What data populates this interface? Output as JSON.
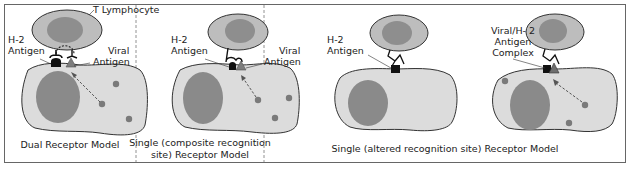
{
  "colors": {
    "cell_fill": "#dcdcdc",
    "nucleus_fill": "#8a8a8a",
    "tcell_fill": "#bdbdbd",
    "tcell_nucleus": "#8e8e8e",
    "viral_dot": "#7a7a7a",
    "h2_antigen": "#111111",
    "viral_antigen": "#7d7d7d",
    "border": "#666666",
    "divider": "#777777"
  },
  "panels": [
    {
      "id": "dual",
      "labels": {
        "tcell": "T Lymphocyte",
        "h2_line1": "H-2",
        "h2_line2": "Antigen",
        "viral_line1": "Viral",
        "viral_line2": "Antigen"
      },
      "caption_line1": "Dual Receptor Model",
      "caption_line2": ""
    },
    {
      "id": "composite",
      "labels": {
        "h2_line1": "H-2",
        "h2_line2": "Antigen",
        "viral_line1": "Viral",
        "viral_line2": "Antigen"
      },
      "caption_line1": "Single (composite recognition",
      "caption_line2": "site) Receptor Model"
    },
    {
      "id": "altered",
      "labels": {
        "left_line1": "H-2",
        "left_line2": "Antigen",
        "right_line1": "Viral/H- 2",
        "right_line2": "Antigen",
        "right_line3": "Complex"
      },
      "caption_line1": "Single (altered recognition site) Receptor Model"
    }
  ]
}
